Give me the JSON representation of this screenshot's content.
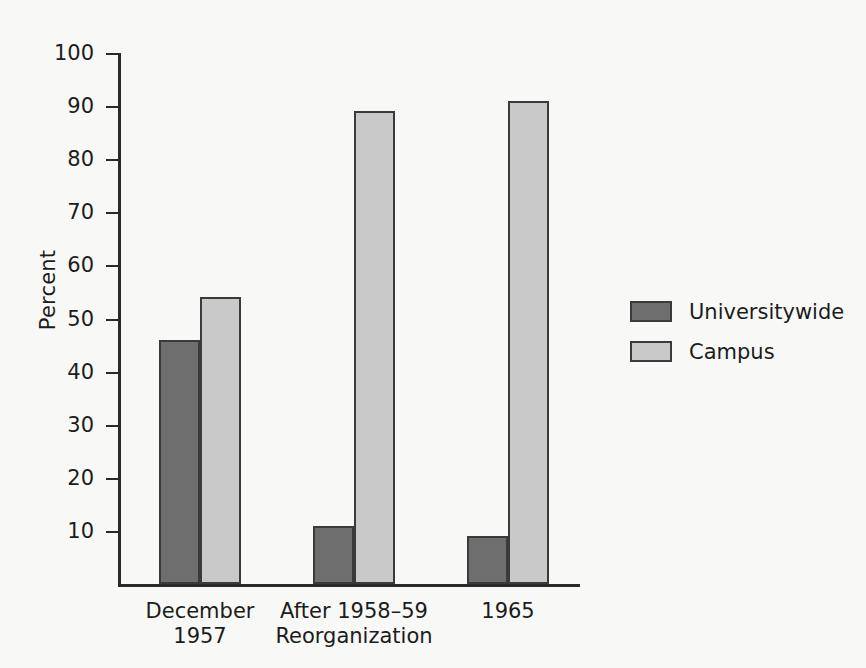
{
  "chart_data": {
    "type": "bar",
    "title": "",
    "subtitle": "",
    "xlabel": "",
    "ylabel": "Percent",
    "ylim": [
      0,
      100
    ],
    "yticks": [
      100,
      90,
      80,
      70,
      60,
      50,
      40,
      30,
      20,
      10
    ],
    "ytick_labels": [
      "100",
      "90",
      "80",
      "70",
      "60",
      "50",
      "40",
      "30",
      "20",
      "10"
    ],
    "grid": false,
    "legend_position": "right",
    "categories": [
      "December\n1957",
      "After 1958–59\nReorganization",
      "1965"
    ],
    "series": [
      {
        "name": "Universitywide",
        "color": "#6e6e6e",
        "values": [
          46,
          11,
          9
        ]
      },
      {
        "name": "Campus",
        "color": "#c9c9c9",
        "values": [
          54,
          89,
          91
        ]
      }
    ],
    "annotations": []
  },
  "legend": {
    "items": [
      {
        "label": "Universitywide",
        "swatch": "legend-swatch-universitywide"
      },
      {
        "label": "Campus",
        "swatch": "legend-swatch-campus"
      }
    ]
  },
  "colors": {
    "background": "#f8f8f6",
    "axis": "#2a2a2a",
    "text": "#1c1c1c",
    "series_universitywide": "#6e6e6e",
    "series_campus": "#c9c9c9"
  }
}
